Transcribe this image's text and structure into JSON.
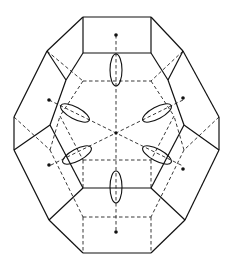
{
  "diagram": {
    "title": "",
    "colors": {
      "line": "#111111",
      "background": "#ffffff"
    },
    "solid_edges": [
      [
        [
          83,
          17
        ],
        [
          151,
          17
        ]
      ],
      [
        [
          83,
          17
        ],
        [
          83,
          53
        ]
      ],
      [
        [
          151,
          17
        ],
        [
          151,
          53
        ]
      ],
      [
        [
          83,
          53
        ],
        [
          151,
          53
        ]
      ],
      [
        [
          83,
          17
        ],
        [
          47,
          51
        ]
      ],
      [
        [
          151,
          17
        ],
        [
          183,
          51
        ]
      ],
      [
        [
          47,
          51
        ],
        [
          14,
          117
        ]
      ],
      [
        [
          183,
          51
        ],
        [
          219,
          117
        ]
      ],
      [
        [
          14,
          117
        ],
        [
          14,
          150
        ]
      ],
      [
        [
          219,
          117
        ],
        [
          219,
          150
        ]
      ],
      [
        [
          14,
          150
        ],
        [
          49,
          220
        ]
      ],
      [
        [
          219,
          150
        ],
        [
          185,
          220
        ]
      ],
      [
        [
          49,
          220
        ],
        [
          83,
          253
        ]
      ],
      [
        [
          185,
          220
        ],
        [
          151,
          253
        ]
      ],
      [
        [
          83,
          253
        ],
        [
          151,
          253
        ]
      ],
      [
        [
          83,
          53
        ],
        [
          66,
          80
        ]
      ],
      [
        [
          151,
          53
        ],
        [
          168,
          80
        ]
      ],
      [
        [
          47,
          51
        ],
        [
          66,
          80
        ]
      ],
      [
        [
          183,
          51
        ],
        [
          168,
          80
        ]
      ],
      [
        [
          66,
          80
        ],
        [
          50,
          125
        ]
      ],
      [
        [
          168,
          80
        ],
        [
          184,
          125
        ]
      ],
      [
        [
          14,
          150
        ],
        [
          50,
          125
        ]
      ],
      [
        [
          219,
          150
        ],
        [
          184,
          125
        ]
      ],
      [
        [
          50,
          125
        ],
        [
          83,
          188
        ]
      ],
      [
        [
          184,
          125
        ],
        [
          151,
          188
        ]
      ],
      [
        [
          83,
          188
        ],
        [
          151,
          188
        ]
      ],
      [
        [
          83,
          188
        ],
        [
          49,
          220
        ]
      ],
      [
        [
          151,
          188
        ],
        [
          185,
          220
        ]
      ]
    ],
    "dashed_edges": [
      [
        [
          83,
          81
        ],
        [
          151,
          81
        ]
      ],
      [
        [
          83,
          81
        ],
        [
          60,
          116
        ]
      ],
      [
        [
          151,
          81
        ],
        [
          174,
          116
        ]
      ],
      [
        [
          60,
          116
        ],
        [
          83,
          160
        ]
      ],
      [
        [
          174,
          116
        ],
        [
          151,
          160
        ]
      ],
      [
        [
          83,
          160
        ],
        [
          151,
          160
        ]
      ],
      [
        [
          47,
          51
        ],
        [
          83,
          81
        ]
      ],
      [
        [
          183,
          51
        ],
        [
          151,
          81
        ]
      ],
      [
        [
          14,
          117
        ],
        [
          50,
          150
        ]
      ],
      [
        [
          219,
          117
        ],
        [
          184,
          150
        ]
      ],
      [
        [
          50,
          150
        ],
        [
          60,
          116
        ]
      ],
      [
        [
          184,
          150
        ],
        [
          174,
          116
        ]
      ],
      [
        [
          50,
          150
        ],
        [
          83,
          217
        ]
      ],
      [
        [
          184,
          150
        ],
        [
          151,
          217
        ]
      ],
      [
        [
          83,
          217
        ],
        [
          151,
          217
        ]
      ],
      [
        [
          83,
          217
        ],
        [
          83,
          253
        ]
      ],
      [
        [
          151,
          217
        ],
        [
          151,
          253
        ]
      ],
      [
        [
          83,
          160
        ],
        [
          83,
          188
        ]
      ],
      [
        [
          151,
          160
        ],
        [
          151,
          188
        ]
      ]
    ],
    "axes": [
      [
        [
          116,
          35
        ],
        [
          116,
          233
        ]
      ],
      [
        [
          49,
          100
        ],
        [
          183,
          166
        ]
      ],
      [
        [
          183,
          100
        ],
        [
          49,
          166
        ]
      ]
    ],
    "center": [
      116,
      133
    ],
    "dots": [
      [
        116,
        35
      ],
      [
        116,
        232
      ],
      [
        49,
        100
      ],
      [
        183,
        98
      ],
      [
        49,
        165
      ],
      [
        183,
        169
      ]
    ],
    "ellipses": [
      {
        "cx": 116,
        "cy": 70,
        "rx": 6,
        "ry": 16,
        "rot": 0
      },
      {
        "cx": 116,
        "cy": 187,
        "rx": 6,
        "ry": 16,
        "rot": 0
      },
      {
        "cx": 75,
        "cy": 113,
        "rx": 16,
        "ry": 6,
        "rot": 28
      },
      {
        "cx": 157,
        "cy": 113,
        "rx": 16,
        "ry": 6,
        "rot": -28
      },
      {
        "cx": 77,
        "cy": 155,
        "rx": 16,
        "ry": 6,
        "rot": -28
      },
      {
        "cx": 157,
        "cy": 155,
        "rx": 16,
        "ry": 6,
        "rot": 28
      }
    ]
  }
}
